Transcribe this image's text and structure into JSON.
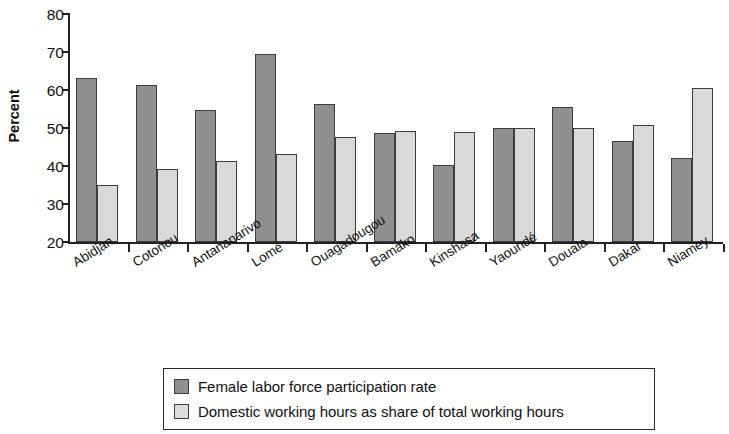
{
  "chart_data": {
    "type": "bar",
    "title": "",
    "subtitle": "",
    "xlabel": "",
    "ylabel": "Percent",
    "ylim": [
      20,
      80
    ],
    "ytick_values": [
      20,
      30,
      40,
      50,
      60,
      70,
      80
    ],
    "ytick_labels": [
      "20",
      "30",
      "40",
      "50",
      "60",
      "70",
      "80"
    ],
    "grid": false,
    "legend_position": "bottom-center",
    "categories": [
      "Abidjan",
      "Cotonou",
      "Antananarivo",
      "Lomé",
      "Ouagadougou",
      "Bamako",
      "Kinshasa",
      "Yaoundé",
      "Douala",
      "Dakar",
      "Niamey"
    ],
    "series": [
      {
        "name": "Female labor force participation rate",
        "color": "#8f8f8f",
        "values": [
          63.2,
          61.4,
          54.7,
          69.5,
          56.3,
          48.6,
          40.2,
          50.1,
          55.4,
          46.6,
          42.2
        ]
      },
      {
        "name": "Domestic working hours as share of total working hours",
        "color": "#d9d9d9",
        "values": [
          34.9,
          39.3,
          41.3,
          43.2,
          47.6,
          49.3,
          49.0,
          50.1,
          49.9,
          50.9,
          60.4
        ]
      }
    ]
  },
  "legend": {
    "entries": [
      {
        "label": "Female labor force participation rate",
        "swatch": "dark"
      },
      {
        "label": "Domestic working hours as share of total working hours",
        "swatch": "light"
      }
    ]
  }
}
